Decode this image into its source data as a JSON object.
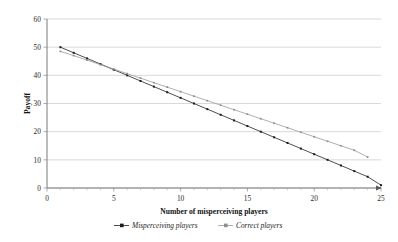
{
  "chart_data": {
    "type": "line",
    "title": "",
    "xlabel": "Number of misperceiving players",
    "ylabel": "Payoff",
    "xlim": [
      0,
      25
    ],
    "ylim": [
      0,
      60
    ],
    "xticks": [
      0,
      5,
      10,
      15,
      20,
      25
    ],
    "yticks": [
      0,
      10,
      20,
      30,
      40,
      50,
      60
    ],
    "xtick_labels": [
      "0",
      "5",
      "10",
      "15",
      "20",
      "25"
    ],
    "ytick_labels": [
      "0",
      "10",
      "20",
      "30",
      "40",
      "50",
      "60"
    ],
    "grid": "horizontal",
    "legend_position": "bottom",
    "series": [
      {
        "name": "Misperceiving players",
        "marker": "square",
        "color": "#1c1c1c",
        "x": [
          1,
          2,
          3,
          4,
          5,
          6,
          7,
          8,
          9,
          10,
          11,
          12,
          13,
          14,
          15,
          16,
          17,
          18,
          19,
          20,
          21,
          22,
          23,
          24,
          25
        ],
        "values": [
          50.0,
          48.0,
          46.0,
          44.0,
          42.0,
          40.0,
          38.0,
          36.0,
          34.0,
          32.0,
          30.0,
          28.0,
          26.0,
          24.0,
          22.0,
          20.0,
          18.0,
          16.0,
          14.0,
          12.0,
          10.0,
          8.0,
          6.0,
          4.0,
          1.0
        ]
      },
      {
        "name": "Correct players",
        "marker": "square",
        "color": "#8d8d8d",
        "x": [
          1,
          2,
          3,
          4,
          5,
          6,
          7,
          8,
          9,
          10,
          11,
          12,
          13,
          14,
          15,
          16,
          17,
          18,
          19,
          20,
          21,
          22,
          23,
          24
        ],
        "values": [
          48.5,
          47.0,
          45.4,
          43.8,
          42.2,
          40.6,
          39.0,
          37.4,
          35.8,
          34.2,
          32.6,
          31.0,
          29.4,
          27.8,
          26.2,
          24.6,
          23.0,
          21.4,
          19.8,
          18.2,
          16.6,
          15.0,
          13.4,
          11.0
        ]
      }
    ],
    "legend": [
      "Misperceiving players",
      "Correct players"
    ]
  }
}
